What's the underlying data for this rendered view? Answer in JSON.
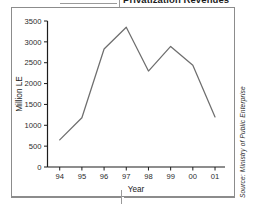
{
  "title": "Privatization Revenues",
  "source_credit": "Source: Ministry of Public Enterprise",
  "chart_data": {
    "type": "line",
    "title": "Privatization Revenues",
    "xlabel": "Year",
    "ylabel": "Million LE",
    "categories": [
      "94",
      "95",
      "96",
      "97",
      "98",
      "99",
      "00",
      "01"
    ],
    "values": [
      650,
      1180,
      2830,
      3350,
      2300,
      2890,
      2440,
      1200
    ],
    "series": [
      {
        "name": "Privatization Revenues",
        "values": [
          650,
          1180,
          2830,
          3350,
          2300,
          2890,
          2440,
          1200
        ]
      }
    ],
    "ylim": [
      0,
      3500
    ],
    "yticks": [
      0,
      500,
      1000,
      1500,
      2000,
      2500,
      3000,
      3500
    ],
    "ytick_labels": [
      "0",
      "500",
      "1000",
      "1500",
      "2000",
      "2500",
      "3000",
      "3500"
    ],
    "xtick_labels": [
      "94",
      "95",
      "96",
      "97",
      "98",
      "99",
      "00",
      "01"
    ],
    "grid": false,
    "legend": "none",
    "line_color": "#6e6e6e",
    "axis_color": "#1c1c1c"
  },
  "colors": {
    "line": "#6e6e6e",
    "axis": "#1c1c1c",
    "frame": "#8c8c8c",
    "text": "#1c1c1c"
  }
}
